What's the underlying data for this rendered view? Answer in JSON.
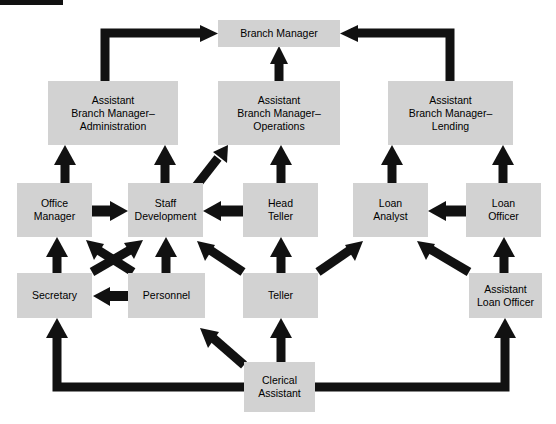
{
  "diagram": {
    "title_bar_present": true,
    "corner_watermark": "",
    "background_color": "#ffffff",
    "box_fill": "#d2d2d2",
    "box_text_color": "#000000",
    "arrow_color": "#111111",
    "type": "organizational-chart",
    "nodes": [
      {
        "id": "branch-manager",
        "label": "Branch Manager",
        "x": 218,
        "y": 20,
        "w": 122,
        "h": 27
      },
      {
        "id": "abm-admin",
        "label": "Assistant\nBranch Manager–\nAdministration",
        "x": 48,
        "y": 81,
        "w": 130,
        "h": 64
      },
      {
        "id": "abm-operations",
        "label": "Assistant\nBranch Manager–\nOperations",
        "x": 218,
        "y": 81,
        "w": 122,
        "h": 64
      },
      {
        "id": "abm-lending",
        "label": "Assistant\nBranch Manager–\nLending",
        "x": 388,
        "y": 81,
        "w": 125,
        "h": 64
      },
      {
        "id": "office-manager",
        "label": "Office\nManager",
        "x": 17,
        "y": 183,
        "w": 75,
        "h": 54
      },
      {
        "id": "staff-development",
        "label": "Staff\nDevelopment",
        "x": 128,
        "y": 183,
        "w": 75,
        "h": 54
      },
      {
        "id": "head-teller",
        "label": "Head\nTeller",
        "x": 243,
        "y": 183,
        "w": 75,
        "h": 54
      },
      {
        "id": "loan-analyst",
        "label": "Loan\nAnalyst",
        "x": 353,
        "y": 183,
        "w": 75,
        "h": 54
      },
      {
        "id": "loan-officer",
        "label": "Loan\nOfficer",
        "x": 466,
        "y": 183,
        "w": 75,
        "h": 54
      },
      {
        "id": "secretary",
        "label": "Secretary",
        "x": 17,
        "y": 273,
        "w": 75,
        "h": 45
      },
      {
        "id": "personnel",
        "label": "Personnel",
        "x": 128,
        "y": 273,
        "w": 77,
        "h": 45
      },
      {
        "id": "teller",
        "label": "Teller",
        "x": 243,
        "y": 273,
        "w": 75,
        "h": 45
      },
      {
        "id": "assistant-loan-officer",
        "label": "Assistant\nLoan Officer",
        "x": 469,
        "y": 273,
        "w": 73,
        "h": 45
      },
      {
        "id": "clerical-assistant",
        "label": "Clerical\nAssistant",
        "x": 244,
        "y": 362,
        "w": 71,
        "h": 50
      }
    ],
    "edges": [
      {
        "id": "abm-admin-to-branch-manager",
        "from": "abm-admin",
        "to": "branch-manager",
        "style": "elbow-up-right"
      },
      {
        "id": "abm-operations-to-branch-manager",
        "from": "abm-operations",
        "to": "branch-manager",
        "style": "straight-up"
      },
      {
        "id": "abm-lending-to-branch-manager",
        "from": "abm-lending",
        "to": "branch-manager",
        "style": "elbow-up-left"
      },
      {
        "id": "office-manager-to-abm-admin",
        "from": "office-manager",
        "to": "abm-admin",
        "style": "straight-up"
      },
      {
        "id": "staff-development-to-abm-admin",
        "from": "staff-development",
        "to": "abm-admin",
        "style": "straight-up"
      },
      {
        "id": "staff-development-to-abm-operations",
        "from": "staff-development",
        "to": "abm-operations",
        "style": "diagonal-up-right"
      },
      {
        "id": "head-teller-to-abm-operations",
        "from": "head-teller",
        "to": "abm-operations",
        "style": "straight-up"
      },
      {
        "id": "loan-analyst-to-abm-lending",
        "from": "loan-analyst",
        "to": "abm-lending",
        "style": "straight-up"
      },
      {
        "id": "loan-officer-to-abm-lending",
        "from": "loan-officer",
        "to": "abm-lending",
        "style": "straight-up"
      },
      {
        "id": "office-manager-to-staff-development",
        "from": "office-manager",
        "to": "staff-development",
        "style": "horizontal-right"
      },
      {
        "id": "head-teller-to-staff-development",
        "from": "head-teller",
        "to": "staff-development",
        "style": "horizontal-left"
      },
      {
        "id": "loan-officer-to-loan-analyst",
        "from": "loan-officer",
        "to": "loan-analyst",
        "style": "horizontal-left"
      },
      {
        "id": "secretary-to-office-manager",
        "from": "secretary",
        "to": "office-manager",
        "style": "straight-up"
      },
      {
        "id": "secretary-to-staff-development",
        "from": "secretary",
        "to": "staff-development",
        "style": "diagonal-cross-up-right"
      },
      {
        "id": "personnel-to-office-manager",
        "from": "personnel",
        "to": "office-manager",
        "style": "diagonal-cross-up-left"
      },
      {
        "id": "personnel-to-staff-development",
        "from": "personnel",
        "to": "staff-development",
        "style": "straight-up"
      },
      {
        "id": "personnel-to-secretary",
        "from": "personnel",
        "to": "secretary",
        "style": "horizontal-left"
      },
      {
        "id": "teller-to-staff-development",
        "from": "teller",
        "to": "staff-development",
        "style": "diagonal-up-left"
      },
      {
        "id": "teller-to-head-teller",
        "from": "teller",
        "to": "head-teller",
        "style": "straight-up"
      },
      {
        "id": "teller-to-loan-analyst",
        "from": "teller",
        "to": "loan-analyst",
        "style": "diagonal-up-right"
      },
      {
        "id": "assistant-loan-officer-to-loan-analyst",
        "from": "assistant-loan-officer",
        "to": "loan-analyst",
        "style": "diagonal-up-left"
      },
      {
        "id": "assistant-loan-officer-to-loan-officer",
        "from": "assistant-loan-officer",
        "to": "loan-officer",
        "style": "straight-up"
      },
      {
        "id": "clerical-assistant-to-secretary",
        "from": "clerical-assistant",
        "to": "secretary",
        "style": "elbow-left-up"
      },
      {
        "id": "clerical-assistant-to-teller",
        "from": "clerical-assistant",
        "to": "teller",
        "style": "straight-up"
      },
      {
        "id": "clerical-assistant-to-personnel",
        "from": "clerical-assistant",
        "to": "personnel",
        "style": "diagonal-up-left"
      },
      {
        "id": "clerical-assistant-to-assistant-loan-officer",
        "from": "clerical-assistant",
        "to": "assistant-loan-officer",
        "style": "elbow-right-up"
      }
    ]
  }
}
